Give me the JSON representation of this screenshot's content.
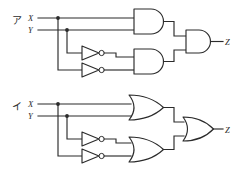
{
  "figure": {
    "title": "",
    "background_color": "#ffffff",
    "line_color": "#2b2b2b",
    "circuits": [
      {
        "id": "circuit-a",
        "label": "ア",
        "gate_type": "AND",
        "inputs": [
          {
            "name": "X",
            "label": "X"
          },
          {
            "name": "Y",
            "label": "Y"
          }
        ],
        "output": {
          "name": "Z",
          "label": "Z"
        },
        "gates": [
          {
            "name": "and-gate-top",
            "type": "AND",
            "inputs": [
              "X",
              "Y"
            ]
          },
          {
            "name": "inverter-x",
            "type": "NOT",
            "inputs": [
              "X"
            ]
          },
          {
            "name": "inverter-y",
            "type": "NOT",
            "inputs": [
              "Y"
            ]
          },
          {
            "name": "and-gate-bottom",
            "type": "AND",
            "inputs": [
              "notX",
              "notY"
            ]
          },
          {
            "name": "and-gate-output",
            "type": "AND",
            "inputs": [
              "and-top",
              "and-bottom"
            ]
          }
        ]
      },
      {
        "id": "circuit-b",
        "label": "イ",
        "gate_type": "OR",
        "inputs": [
          {
            "name": "X",
            "label": "X"
          },
          {
            "name": "Y",
            "label": "Y"
          }
        ],
        "output": {
          "name": "Z",
          "label": "Z"
        },
        "gates": [
          {
            "name": "or-gate-top",
            "type": "OR",
            "inputs": [
              "X",
              "Y"
            ]
          },
          {
            "name": "inverter-x",
            "type": "NOT",
            "inputs": [
              "X"
            ]
          },
          {
            "name": "inverter-y",
            "type": "NOT",
            "inputs": [
              "Y"
            ]
          },
          {
            "name": "or-gate-bottom",
            "type": "OR",
            "inputs": [
              "notX",
              "notY"
            ]
          },
          {
            "name": "or-gate-output",
            "type": "OR",
            "inputs": [
              "or-top",
              "or-bottom"
            ]
          }
        ]
      }
    ]
  }
}
